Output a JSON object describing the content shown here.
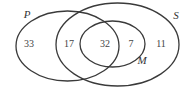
{
  "diagram": {
    "type": "venn",
    "sets": [
      {
        "id": "P",
        "label": "P",
        "cx": 67.5,
        "cy": 46,
        "rx": 51.5,
        "ry": 35,
        "label_x": 27,
        "label_y": 18
      },
      {
        "id": "S",
        "label": "S",
        "cx": 117.5,
        "cy": 44.5,
        "rx": 61.5,
        "ry": 41.5,
        "label_x": 176,
        "label_y": 19
      },
      {
        "id": "M",
        "label": "M",
        "cx": 112.5,
        "cy": 44,
        "rx": 32.5,
        "ry": 23,
        "label_x": 142,
        "label_y": 64
      }
    ],
    "regions": [
      {
        "id": "P_only",
        "description": "P only",
        "value": "33",
        "x": 29,
        "y": 47
      },
      {
        "id": "P_and_S_not_M",
        "description": "P and S, not M",
        "value": "17",
        "x": 69,
        "y": 47
      },
      {
        "id": "P_and_S_and_M",
        "description": "P, S and M",
        "value": "32",
        "x": 105,
        "y": 47
      },
      {
        "id": "S_and_M_not_P",
        "description": "S and M, not P",
        "value": "7",
        "x": 131,
        "y": 47
      },
      {
        "id": "S_only",
        "description": "S only, not M",
        "value": "11",
        "x": 161,
        "y": 47
      }
    ],
    "colors": {
      "stroke": "#3a3a3a",
      "text": "#444444",
      "background": "#ffffff"
    }
  }
}
